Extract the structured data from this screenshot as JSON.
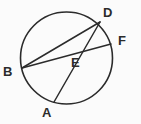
{
  "figure": {
    "kind": "circle-geometry-diagram",
    "background_color": "#fbfbfb",
    "stroke_color": "#2b2b2b",
    "label_color": "#2b2b2b",
    "canvas": {
      "width": 141,
      "height": 124
    },
    "circle": {
      "cx": 66.5,
      "cy": 58,
      "r": 46,
      "stroke_width": 1.6
    },
    "points": {
      "A": {
        "x": 54,
        "y": 102,
        "label": "A",
        "on_circle": true
      },
      "B": {
        "x": 22,
        "y": 68,
        "label": "B",
        "on_circle": true
      },
      "D": {
        "x": 100,
        "y": 22,
        "label": "D",
        "on_circle": true
      },
      "F": {
        "x": 111,
        "y": 44,
        "label": "F",
        "on_circle": true
      },
      "E": {
        "x": 67,
        "y": 55,
        "label": "E",
        "on_circle": false
      }
    },
    "segments": [
      {
        "name": "chord-B-D",
        "from": "B",
        "to": "D",
        "x1": 22,
        "y1": 68,
        "x2": 100,
        "y2": 22
      },
      {
        "name": "chord-B-F",
        "from": "B",
        "to": "F",
        "x1": 22,
        "y1": 68,
        "x2": 111,
        "y2": 44
      },
      {
        "name": "chord-A-D",
        "from": "A",
        "to": "D",
        "x1": 54,
        "y1": 102,
        "x2": 100,
        "y2": 22
      }
    ],
    "labels": [
      {
        "id": "A",
        "text": "A"
      },
      {
        "id": "B",
        "text": "B"
      },
      {
        "id": "D",
        "text": "D"
      },
      {
        "id": "E",
        "text": "E"
      },
      {
        "id": "F",
        "text": "F"
      }
    ]
  }
}
